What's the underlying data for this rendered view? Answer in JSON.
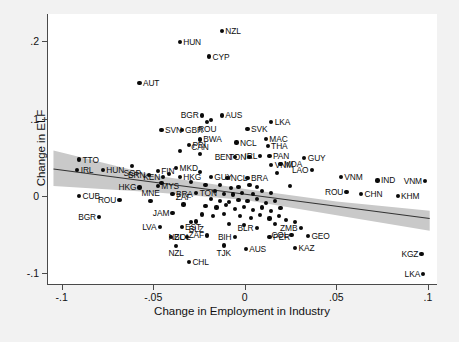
{
  "chart_data": {
    "type": "scatter",
    "title": "",
    "xlabel": "Change in Employment in Industry",
    "ylabel": "Change in ELF",
    "xlim": [
      -0.108,
      0.105
    ],
    "ylim": [
      -0.115,
      0.235
    ],
    "xticks": [
      -0.1,
      -0.05,
      0,
      0.05,
      0.1
    ],
    "xticklabels": [
      "-.1",
      "-.05",
      "0",
      ".05",
      ".1"
    ],
    "yticks": [
      0.2,
      0.1,
      0,
      -0.1
    ],
    "yticklabels": [
      ".2",
      ".1",
      "0",
      "-.1"
    ],
    "grid": false,
    "legend": null,
    "marker_color": "#0a0a0a",
    "band_color": "#c9c9c9",
    "fit_line_color": "#333333",
    "plot_bg": "#ffffff",
    "figure_bg": "#f2f2f2",
    "fit_line": {
      "label": "linear fit",
      "x": [
        -0.105,
        0.101
      ],
      "y": [
        0.034,
        -0.03
      ]
    },
    "confidence_band": {
      "label": "95% CI",
      "x": [
        -0.105,
        -0.05,
        0.0,
        0.05,
        0.101
      ],
      "upper": [
        0.058,
        0.026,
        0.008,
        -0.008,
        -0.02
      ],
      "lower": [
        0.012,
        0.004,
        -0.006,
        -0.026,
        -0.046
      ]
    },
    "points": [
      {
        "label": "NZL",
        "x": -0.013,
        "y": 0.213,
        "pos": "l"
      },
      {
        "label": "HUN",
        "x": -0.036,
        "y": 0.199,
        "pos": "l"
      },
      {
        "label": "CYP",
        "x": -0.02,
        "y": 0.18,
        "pos": "l"
      },
      {
        "label": "AUT",
        "x": -0.058,
        "y": 0.146,
        "pos": "l"
      },
      {
        "label": "BGR",
        "x": -0.024,
        "y": 0.104,
        "pos": "r"
      },
      {
        "label": "AUS",
        "x": -0.013,
        "y": 0.104,
        "pos": "l"
      },
      {
        "label": "LKA",
        "x": 0.014,
        "y": 0.096,
        "pos": "l"
      },
      {
        "label": "ROU",
        "x": -0.021,
        "y": 0.096,
        "pos": "b"
      },
      {
        "label": "SVN",
        "x": -0.046,
        "y": 0.085,
        "pos": "l"
      },
      {
        "label": "GBR",
        "x": -0.035,
        "y": 0.085,
        "pos": "l"
      },
      {
        "label": "SVK",
        "x": 0.001,
        "y": 0.086,
        "pos": "l"
      },
      {
        "label": "BWA",
        "x": -0.025,
        "y": 0.073,
        "pos": "l"
      },
      {
        "label": "MAC",
        "x": 0.011,
        "y": 0.074,
        "pos": "l"
      },
      {
        "label": "NCL",
        "x": -0.005,
        "y": 0.069,
        "pos": "l"
      },
      {
        "label": "THA",
        "x": 0.012,
        "y": 0.064,
        "pos": "l"
      },
      {
        "label": "PRI",
        "x": -0.031,
        "y": 0.066,
        "pos": "l"
      },
      {
        "label": "CAN",
        "x": -0.025,
        "y": 0.054,
        "pos": "t"
      },
      {
        "label": "TTO",
        "x": -0.091,
        "y": 0.047,
        "pos": "l"
      },
      {
        "label": "GUY",
        "x": 0.032,
        "y": 0.049,
        "pos": "l"
      },
      {
        "label": "BEN",
        "x": -0.006,
        "y": 0.05,
        "pos": "r"
      },
      {
        "label": "TON",
        "x": 0.002,
        "y": 0.05,
        "pos": "r"
      },
      {
        "label": "IRL",
        "x": 0.008,
        "y": 0.052,
        "pos": "r"
      },
      {
        "label": "PAN",
        "x": 0.013,
        "y": 0.052,
        "pos": "l"
      },
      {
        "label": "MDA",
        "x": 0.019,
        "y": 0.041,
        "pos": "l"
      },
      {
        "label": "IRL",
        "x": -0.092,
        "y": 0.034,
        "pos": "l"
      },
      {
        "label": "HUN",
        "x": -0.078,
        "y": 0.034,
        "pos": "l"
      },
      {
        "label": "SGP",
        "x": -0.062,
        "y": 0.039,
        "pos": "b"
      },
      {
        "label": "FIN",
        "x": -0.048,
        "y": 0.032,
        "pos": "l"
      },
      {
        "label": "MKD",
        "x": -0.038,
        "y": 0.036,
        "pos": "l"
      },
      {
        "label": "BRN",
        "x": -0.053,
        "y": 0.027,
        "pos": "r"
      },
      {
        "label": "KEN",
        "x": -0.045,
        "y": 0.024,
        "pos": "r"
      },
      {
        "label": "HKG",
        "x": -0.036,
        "y": 0.024,
        "pos": "l"
      },
      {
        "label": "GUY",
        "x": -0.019,
        "y": 0.025,
        "pos": "l"
      },
      {
        "label": "NCL",
        "x": -0.01,
        "y": 0.023,
        "pos": "l"
      },
      {
        "label": "BRA",
        "x": 0.001,
        "y": 0.023,
        "pos": "l"
      },
      {
        "label": "VNM",
        "x": 0.014,
        "y": 0.04,
        "pos": "l"
      },
      {
        "label": "LAO",
        "x": 0.036,
        "y": 0.033,
        "pos": "r"
      },
      {
        "label": "VNM",
        "x": 0.052,
        "y": 0.025,
        "pos": "l"
      },
      {
        "label": "IND",
        "x": 0.072,
        "y": 0.02,
        "pos": "l"
      },
      {
        "label": "VNM",
        "x": 0.098,
        "y": 0.019,
        "pos": "r"
      },
      {
        "label": "HKG",
        "x": -0.058,
        "y": 0.011,
        "pos": "r"
      },
      {
        "label": "MYS",
        "x": -0.048,
        "y": 0.013,
        "pos": "l"
      },
      {
        "label": "BRA",
        "x": -0.04,
        "y": 0.003,
        "pos": "l"
      },
      {
        "label": "TON",
        "x": -0.027,
        "y": 0.004,
        "pos": "l"
      },
      {
        "label": "CUB",
        "x": -0.091,
        "y": 0.0,
        "pos": "l"
      },
      {
        "label": "ROU",
        "x": -0.069,
        "y": -0.005,
        "pos": "r"
      },
      {
        "label": "MNE",
        "x": -0.052,
        "y": -0.006,
        "pos": "t"
      },
      {
        "label": "ZAF",
        "x": -0.034,
        "y": -0.011,
        "pos": "t"
      },
      {
        "label": "ROU",
        "x": 0.055,
        "y": 0.005,
        "pos": "r"
      },
      {
        "label": "CHN",
        "x": 0.063,
        "y": 0.003,
        "pos": "l"
      },
      {
        "label": "KHM",
        "x": 0.083,
        "y": 0.0,
        "pos": "l"
      },
      {
        "label": "BGR",
        "x": -0.08,
        "y": -0.027,
        "pos": "r"
      },
      {
        "label": "JAM",
        "x": -0.04,
        "y": -0.022,
        "pos": "r"
      },
      {
        "label": "LVA",
        "x": -0.047,
        "y": -0.04,
        "pos": "r"
      },
      {
        "label": "EST",
        "x": -0.035,
        "y": -0.04,
        "pos": "l"
      },
      {
        "label": "BLZ",
        "x": -0.027,
        "y": -0.033,
        "pos": "b"
      },
      {
        "label": "BLR",
        "x": 0.006,
        "y": -0.041,
        "pos": "r"
      },
      {
        "label": "ZMB",
        "x": 0.03,
        "y": -0.041,
        "pos": "r"
      },
      {
        "label": "COL",
        "x": 0.025,
        "y": -0.05,
        "pos": "r"
      },
      {
        "label": "PER",
        "x": 0.013,
        "y": -0.053,
        "pos": "l"
      },
      {
        "label": "GEO",
        "x": 0.034,
        "y": -0.052,
        "pos": "l"
      },
      {
        "label": "BOL",
        "x": -0.041,
        "y": -0.053,
        "pos": "l"
      },
      {
        "label": "NZL",
        "x": -0.032,
        "y": -0.053,
        "pos": "r"
      },
      {
        "label": "ZAF",
        "x": -0.021,
        "y": -0.051,
        "pos": "r"
      },
      {
        "label": "BIH",
        "x": -0.006,
        "y": -0.053,
        "pos": "r"
      },
      {
        "label": "NZL",
        "x": -0.038,
        "y": -0.065,
        "pos": "b"
      },
      {
        "label": "TJK",
        "x": -0.012,
        "y": -0.064,
        "pos": "b"
      },
      {
        "label": "AUS",
        "x": 0.0,
        "y": -0.068,
        "pos": "l"
      },
      {
        "label": "KAZ",
        "x": 0.027,
        "y": -0.067,
        "pos": "l"
      },
      {
        "label": "KGZ",
        "x": 0.096,
        "y": -0.075,
        "pos": "r"
      },
      {
        "label": "CHL",
        "x": -0.031,
        "y": -0.085,
        "pos": "l"
      },
      {
        "label": "LKA",
        "x": 0.097,
        "y": -0.101,
        "pos": "r"
      },
      {
        "label": "",
        "x": -0.019,
        "y": 0.098,
        "pos": "l"
      },
      {
        "label": "",
        "x": -0.03,
        "y": 0.018,
        "pos": "l"
      },
      {
        "label": "",
        "x": -0.022,
        "y": 0.014,
        "pos": "l"
      },
      {
        "label": "",
        "x": -0.014,
        "y": 0.014,
        "pos": "l"
      },
      {
        "label": "",
        "x": -0.008,
        "y": 0.01,
        "pos": "l"
      },
      {
        "label": "",
        "x": -0.004,
        "y": 0.012,
        "pos": "l"
      },
      {
        "label": "",
        "x": 0.002,
        "y": 0.014,
        "pos": "l"
      },
      {
        "label": "",
        "x": 0.006,
        "y": 0.012,
        "pos": "l"
      },
      {
        "label": "",
        "x": -0.017,
        "y": 0.006,
        "pos": "l"
      },
      {
        "label": "",
        "x": -0.012,
        "y": 0.003,
        "pos": "l"
      },
      {
        "label": "",
        "x": -0.007,
        "y": 0.002,
        "pos": "l"
      },
      {
        "label": "",
        "x": -0.002,
        "y": 0.004,
        "pos": "l"
      },
      {
        "label": "",
        "x": 0.004,
        "y": 0.003,
        "pos": "l"
      },
      {
        "label": "",
        "x": 0.009,
        "y": 0.006,
        "pos": "l"
      },
      {
        "label": "",
        "x": 0.014,
        "y": 0.004,
        "pos": "l"
      },
      {
        "label": "",
        "x": -0.019,
        "y": -0.004,
        "pos": "l"
      },
      {
        "label": "",
        "x": -0.014,
        "y": -0.006,
        "pos": "l"
      },
      {
        "label": "",
        "x": -0.009,
        "y": -0.008,
        "pos": "l"
      },
      {
        "label": "",
        "x": -0.004,
        "y": -0.005,
        "pos": "l"
      },
      {
        "label": "",
        "x": 0.001,
        "y": -0.007,
        "pos": "l"
      },
      {
        "label": "",
        "x": 0.006,
        "y": -0.004,
        "pos": "l"
      },
      {
        "label": "",
        "x": 0.011,
        "y": -0.009,
        "pos": "l"
      },
      {
        "label": "",
        "x": 0.016,
        "y": -0.006,
        "pos": "l"
      },
      {
        "label": "",
        "x": -0.022,
        "y": -0.013,
        "pos": "l"
      },
      {
        "label": "",
        "x": -0.016,
        "y": -0.015,
        "pos": "l"
      },
      {
        "label": "",
        "x": -0.011,
        "y": -0.012,
        "pos": "l"
      },
      {
        "label": "",
        "x": -0.006,
        "y": -0.017,
        "pos": "l"
      },
      {
        "label": "",
        "x": -0.001,
        "y": -0.014,
        "pos": "l"
      },
      {
        "label": "",
        "x": 0.004,
        "y": -0.018,
        "pos": "l"
      },
      {
        "label": "",
        "x": 0.009,
        "y": -0.015,
        "pos": "l"
      },
      {
        "label": "",
        "x": 0.014,
        "y": -0.019,
        "pos": "l"
      },
      {
        "label": "",
        "x": 0.019,
        "y": -0.016,
        "pos": "l"
      },
      {
        "label": "",
        "x": -0.024,
        "y": -0.024,
        "pos": "l"
      },
      {
        "label": "",
        "x": -0.018,
        "y": -0.026,
        "pos": "l"
      },
      {
        "label": "",
        "x": -0.012,
        "y": -0.023,
        "pos": "l"
      },
      {
        "label": "",
        "x": -0.003,
        "y": -0.026,
        "pos": "l"
      },
      {
        "label": "",
        "x": 0.003,
        "y": -0.028,
        "pos": "l"
      },
      {
        "label": "",
        "x": 0.008,
        "y": -0.025,
        "pos": "l"
      },
      {
        "label": "",
        "x": 0.013,
        "y": -0.029,
        "pos": "l"
      },
      {
        "label": "",
        "x": 0.018,
        "y": -0.026,
        "pos": "l"
      },
      {
        "label": "",
        "x": 0.022,
        "y": -0.031,
        "pos": "l"
      },
      {
        "label": "",
        "x": -0.03,
        "y": -0.034,
        "pos": "l"
      },
      {
        "label": "",
        "x": -0.009,
        "y": -0.036,
        "pos": "l"
      },
      {
        "label": "",
        "x": -0.001,
        "y": -0.038,
        "pos": "l"
      },
      {
        "label": "",
        "x": 0.016,
        "y": -0.036,
        "pos": "l"
      },
      {
        "label": "",
        "x": 0.027,
        "y": -0.034,
        "pos": "l"
      },
      {
        "label": "",
        "x": -0.036,
        "y": 0.058,
        "pos": "l"
      },
      {
        "label": "",
        "x": -0.042,
        "y": 0.028,
        "pos": "l"
      },
      {
        "label": "",
        "x": -0.025,
        "y": 0.031,
        "pos": "l"
      },
      {
        "label": "",
        "x": 0.017,
        "y": 0.03,
        "pos": "l"
      },
      {
        "label": "",
        "x": 0.024,
        "y": 0.013,
        "pos": "l"
      },
      {
        "label": "",
        "x": -0.046,
        "y": 0.017,
        "pos": "l"
      }
    ]
  }
}
